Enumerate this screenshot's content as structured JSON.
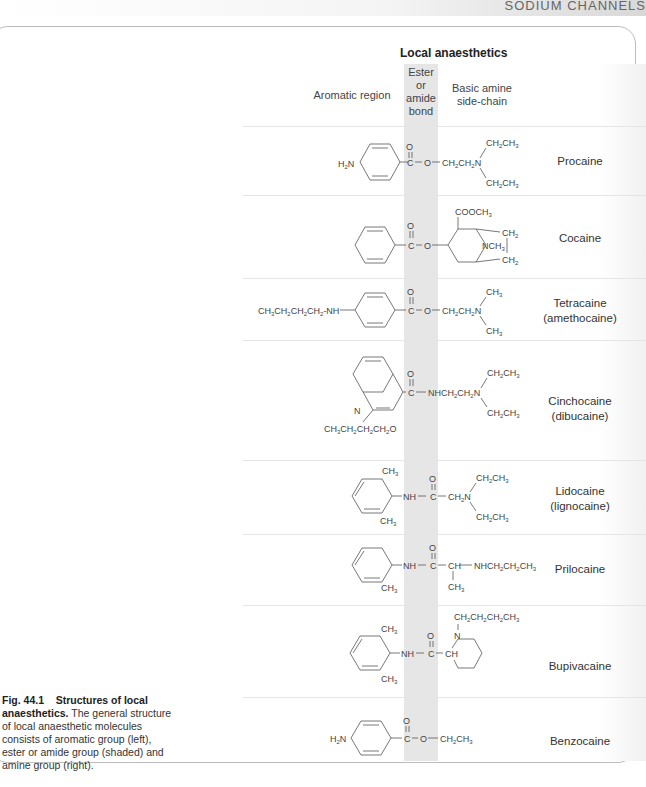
{
  "header_strip": {
    "text": "SODIUM CHANNELS"
  },
  "figure": {
    "title": "Local anaesthetics",
    "column_headers": {
      "aromatic": "Aromatic region",
      "bond": [
        "Ester",
        "or",
        "amide",
        "bond"
      ],
      "amine": [
        "Basic amine",
        "side-chain"
      ]
    },
    "compounds": [
      {
        "name": "Procaine",
        "alt": "",
        "aromatic": "H2N-C6H4-",
        "bond": "C(=O)-O",
        "amine": "-CH2CH2N(CH2CH3)2"
      },
      {
        "name": "Cocaine",
        "alt": "",
        "aromatic": "C6H5-",
        "bond": "C(=O)-O",
        "amine": "tropane ring: COOCH3, NCH3, CH2, CH2"
      },
      {
        "name": "Tetracaine",
        "alt": "(amethocaine)",
        "aromatic": "CH3CH2CH2CH2-NH-C6H4-",
        "bond": "C(=O)-O",
        "amine": "-CH2CH2N(CH3)2"
      },
      {
        "name": "Cinchocaine",
        "alt": "(dibucaine)",
        "aromatic": "quinoline with CH3CH2CH2CH2O",
        "bond": "C(=O)",
        "amine": "-NHCH2CH2N(CH2CH3)2"
      },
      {
        "name": "Lidocaine",
        "alt": "(lignocaine)",
        "aromatic": "2,6-(CH3)2C6H3-NH-",
        "bond": "C(=O)",
        "amine": "-CH2N(CH2CH3)2"
      },
      {
        "name": "Prilocaine",
        "alt": "",
        "aromatic": "2-CH3C6H4-NH-",
        "bond": "C(=O)",
        "amine": "-CH(CH3)-NHCH2CH2CH3"
      },
      {
        "name": "Bupivacaine",
        "alt": "",
        "aromatic": "2,6-(CH3)2C6H3-NH-",
        "bond": "C(=O)",
        "amine": "piperidine CH with N-CH2CH2CH2CH3"
      },
      {
        "name": "Benzocaine",
        "alt": "",
        "aromatic": "H2N-C6H4-",
        "bond": "C(=O)-O",
        "amine": "-CH2CH3"
      }
    ]
  },
  "caption": {
    "label": "Fig. 44.1",
    "title": "Structures of local anaesthetics.",
    "text": "The general structure of local anaesthetic molecules consists of aromatic group (left), ester or amide group (shaded) and amine group (right)."
  }
}
